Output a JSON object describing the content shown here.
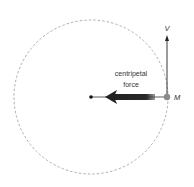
{
  "diagram": {
    "title": "",
    "labels": {
      "force_line1": "centripetal",
      "force_line2": "force",
      "velocity": "V",
      "mass": "M"
    },
    "colors": {
      "circle": "#9a9a9a",
      "arrow": "#222222",
      "mass_dot": "#8a8a8a",
      "text": "#333333"
    }
  }
}
